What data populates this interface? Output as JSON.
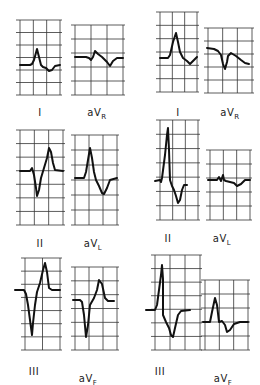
{
  "figure": {
    "colors": {
      "grid": "#333333",
      "trace": "#111111",
      "label": "#222222",
      "background": "#ffffff"
    },
    "panels": [
      {
        "id": "L-I",
        "lead": "I",
        "sub": "",
        "label_x": 40,
        "label_y": 99,
        "grid": {
          "x": 20,
          "y": 20,
          "w": 40,
          "h": 75,
          "cols": 3,
          "rows": 6
        },
        "trace": "M20,65 L30,65 L32,64 L34,60 L37,49 L39,57 L41,65 L43,67 L46,68 L49,71 L52,70 L55,66 L60,65"
      },
      {
        "id": "L-aVR",
        "lead": "aV",
        "sub": "R",
        "label_x": 97,
        "label_y": 99,
        "grid": {
          "x": 75,
          "y": 25,
          "w": 48,
          "h": 70,
          "cols": 3,
          "rows": 5
        },
        "trace": "M75,57 L86,57 L89,58 L91,60 L93,57 L95,51 L98,54 L102,57 L107,62 L110,66 L113,61 L117,58 L123,58"
      },
      {
        "id": "R-I",
        "lead": "I",
        "sub": "",
        "label_x": 178,
        "label_y": 99,
        "grid": {
          "x": 160,
          "y": 12,
          "w": 37,
          "h": 80,
          "cols": 3,
          "rows": 6
        },
        "trace": "M160,58 L168,58 L170,55 L173,42 L176,33 L178,42 L180,52 L183,58 L187,61 L190,64 L194,60 L197,57"
      },
      {
        "id": "R-aVR",
        "lead": "aV",
        "sub": "R",
        "label_x": 230,
        "label_y": 99,
        "grid": {
          "x": 208,
          "y": 28,
          "w": 44,
          "h": 65,
          "cols": 3,
          "rows": 5
        },
        "trace": "M207,48 L214,49 L218,51 L221,55 L223,64 L225,69 L227,62 L228,56 L231,53 L236,56 L241,60 L245,63 L249,64"
      },
      {
        "id": "L-II",
        "lead": "II",
        "sub": "",
        "label_x": 40,
        "label_y": 230,
        "grid": {
          "x": 20,
          "y": 130,
          "w": 43,
          "h": 95,
          "cols": 3,
          "rows": 7
        },
        "trace": "M20,171 L30,171 L32,168 L34,175 L36,188 L37,196 L39,190 L41,178 L44,168 L47,158 L49,148 L51,152 L53,163 L55,170 L63,171"
      },
      {
        "id": "L-aVL",
        "lead": "aV",
        "sub": "L",
        "label_x": 93,
        "label_y": 230,
        "grid": {
          "x": 75,
          "y": 135,
          "w": 42,
          "h": 90,
          "cols": 3,
          "rows": 6
        },
        "trace": "M75,178 L84,178 L86,172 L88,160 L90,148 L92,158 L94,172 L96,180 L99,186 L102,193 L104,194 L107,188 L110,180 L117,178"
      },
      {
        "id": "R-II",
        "lead": "II",
        "sub": "",
        "label_x": 168,
        "label_y": 225,
        "grid": {
          "x": 160,
          "y": 120,
          "w": 38,
          "h": 100,
          "cols": 3,
          "rows": 7
        },
        "trace": "M155,181 L160,180 L161,182 L162,178 L165,155 L167,135 L168,128 L169,150 L170,180 L172,186 L174,190 L176,196 L178,203 L180,200 L182,190 L184,185 L187,185"
      },
      {
        "id": "R-aVL",
        "lead": "aV",
        "sub": "L",
        "label_x": 222,
        "label_y": 225,
        "grid": {
          "x": 210,
          "y": 150,
          "w": 40,
          "h": 70,
          "cols": 3,
          "rows": 5
        },
        "trace": "M208,180 L217,180 L219,177 L221,181 L223,175 L224,180 L226,181 L230,182 L234,183 L237,186 L241,184 L245,180 L250,180"
      },
      {
        "id": "L-III",
        "lead": "III",
        "sub": "",
        "label_x": 34,
        "label_y": 358,
        "grid": {
          "x": 25,
          "y": 258,
          "w": 35,
          "h": 92,
          "cols": 2,
          "rows": 7
        },
        "trace": "M15,290 L24,290 L26,294 L28,305 L30,320 L32,335 L33,323 L35,305 L37,292 L40,283 L43,270 L45,263 L47,272 L49,288 L52,290 L60,290"
      },
      {
        "id": "L-aVF",
        "lead": "aV",
        "sub": "F",
        "label_x": 88,
        "label_y": 365,
        "grid": {
          "x": 75,
          "y": 267,
          "w": 42,
          "h": 83,
          "cols": 3,
          "rows": 6
        },
        "trace": "M73,300 L80,300 L82,302 L84,315 L86,337 L88,325 L90,305 L94,298 L97,290 L99,280 L102,284 L105,298 L108,301 L114,301"
      },
      {
        "id": "R-III",
        "lead": "III",
        "sub": "",
        "label_x": 160,
        "label_y": 358,
        "grid": {
          "x": 155,
          "y": 255,
          "w": 45,
          "h": 95,
          "cols": 3,
          "rows": 7
        },
        "trace": "M146,310 L155,310 L157,305 L159,290 L161,275 L162,265 L163,279 L163,315 L166,322 L169,328 L171,335 L173,337 L175,328 L178,315 L181,311 L190,310"
      },
      {
        "id": "R-aVF",
        "lead": "aV",
        "sub": "F",
        "label_x": 223,
        "label_y": 365,
        "grid": {
          "x": 205,
          "y": 280,
          "w": 43,
          "h": 70,
          "cols": 3,
          "rows": 5
        },
        "trace": "M203,322 L210,322 L212,312 L215,298 L217,305 L219,322 L222,321 L225,325 L227,332 L230,330 L234,324 L240,322 L248,322"
      }
    ]
  }
}
